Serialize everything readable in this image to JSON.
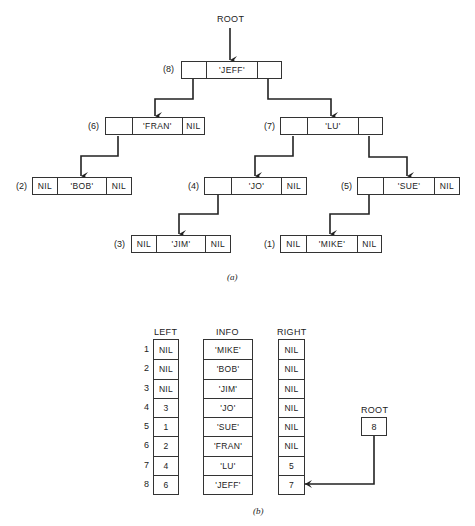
{
  "part_a": {
    "root_label": "ROOT",
    "caption": "(a)",
    "nodes": [
      {
        "id": "8",
        "index_label": "(8)",
        "left": "",
        "info": "'JEFF'",
        "right": ""
      },
      {
        "id": "6",
        "index_label": "(6)",
        "left": "",
        "info": "'FRAN'",
        "right": "NIL"
      },
      {
        "id": "7",
        "index_label": "(7)",
        "left": "",
        "info": "'LU'",
        "right": ""
      },
      {
        "id": "2",
        "index_label": "(2)",
        "left": "NIL",
        "info": "'BOB'",
        "right": "NIL"
      },
      {
        "id": "4",
        "index_label": "(4)",
        "left": "",
        "info": "'JO'",
        "right": "NIL"
      },
      {
        "id": "5",
        "index_label": "(5)",
        "left": "",
        "info": "'SUE'",
        "right": "NIL"
      },
      {
        "id": "3",
        "index_label": "(3)",
        "left": "NIL",
        "info": "'JIM'",
        "right": "NIL"
      },
      {
        "id": "1",
        "index_label": "(1)",
        "left": "NIL",
        "info": "'MIKE'",
        "right": "NIL"
      }
    ],
    "edges": [
      {
        "from": "ROOT",
        "to": "8"
      },
      {
        "from": "8",
        "to": "6",
        "side": "left"
      },
      {
        "from": "8",
        "to": "7",
        "side": "right"
      },
      {
        "from": "6",
        "to": "2",
        "side": "left"
      },
      {
        "from": "7",
        "to": "4",
        "side": "left"
      },
      {
        "from": "7",
        "to": "5",
        "side": "right"
      },
      {
        "from": "4",
        "to": "3",
        "side": "left"
      },
      {
        "from": "5",
        "to": "1",
        "side": "left"
      }
    ]
  },
  "part_b": {
    "caption": "(b)",
    "headers": {
      "left": "LEFT",
      "info": "INFO",
      "right": "RIGHT"
    },
    "row_numbers": [
      "1",
      "2",
      "3",
      "4",
      "5",
      "6",
      "7",
      "8"
    ],
    "left": [
      "NIL",
      "NIL",
      "NIL",
      "3",
      "1",
      "2",
      "4",
      "6"
    ],
    "info": [
      "'MIKE'",
      "'BOB'",
      "'JIM'",
      "'JO'",
      "'SUE'",
      "'FRAN'",
      "'LU'",
      "'JEFF'"
    ],
    "right": [
      "NIL",
      "NIL",
      "NIL",
      "NIL",
      "NIL",
      "NIL",
      "5",
      "7"
    ],
    "root": {
      "label": "ROOT",
      "value": "8",
      "points_to_row": "8"
    }
  }
}
